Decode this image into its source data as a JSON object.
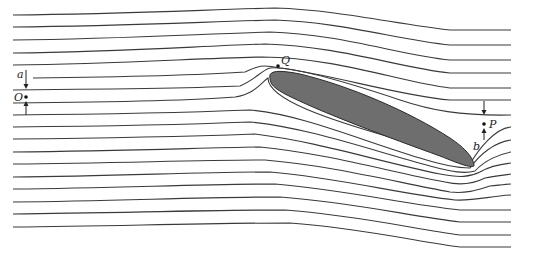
{
  "diagram": {
    "colors": {
      "streamline": "#3a3a3a",
      "airfoil_fill": "#6e6e6e",
      "airfoil_stroke": "#2a2a2a",
      "background": "#ffffff"
    },
    "labels": {
      "a": "a",
      "O": "O",
      "Q": "Q",
      "P": "P",
      "b": "b"
    },
    "streamline_count": 18,
    "points": [
      {
        "name": "O",
        "description": "upstream point between streamlines separated by a"
      },
      {
        "name": "Q",
        "description": "point near leading edge of airfoil"
      },
      {
        "name": "P",
        "description": "downstream point between streamlines separated by b"
      }
    ]
  }
}
